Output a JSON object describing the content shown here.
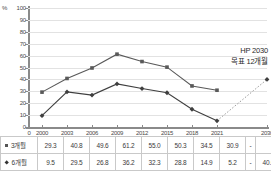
{
  "chart_data": {
    "type": "line",
    "title": "",
    "xlabel": "",
    "ylabel": "%",
    "ylim": [
      0,
      100
    ],
    "ytick_step": 10,
    "yticks": [
      0,
      10,
      20,
      30,
      40,
      50,
      60,
      70,
      80,
      90,
      100
    ],
    "grid": true,
    "legend_position": "table-row-labels",
    "categories": [
      "2000",
      "2003",
      "2006",
      "2009",
      "2012",
      "2015",
      "2018",
      "2021",
      "",
      "2030"
    ],
    "axis_origin_label": "0",
    "series": [
      {
        "name": "3개월",
        "marker": "square",
        "color": "#595959",
        "values": [
          29.3,
          40.8,
          49.6,
          61.2,
          55.0,
          50.3,
          34.5,
          30.9,
          null,
          null
        ],
        "display": [
          "29.3",
          "40.8",
          "49.6",
          "61.2",
          "55.0",
          "50.3",
          "34.5",
          "30.9",
          "-",
          ""
        ]
      },
      {
        "name": "6개월",
        "marker": "diamond",
        "color": "#3f3f3f",
        "values": [
          9.5,
          29.5,
          26.8,
          36.2,
          32.3,
          28.8,
          14.9,
          5.2,
          null,
          40.0
        ],
        "display": [
          "9.5",
          "29.5",
          "26.8",
          "36.2",
          "32.3",
          "28.8",
          "14.9",
          "5.2",
          "-",
          "40.0"
        ],
        "projection": {
          "from_category": "2021",
          "to_category": "2030",
          "from_value": 5.2,
          "to_value": 40.0,
          "style": "dotted"
        }
      }
    ],
    "annotations": [
      {
        "line1": "HP 2030",
        "line2": "목표 12개월"
      }
    ]
  },
  "chart": {
    "y_axis_unit": "%",
    "y_ticks": [
      "100",
      "90",
      "80",
      "70",
      "60",
      "50",
      "40",
      "30",
      "20",
      "10",
      "0"
    ],
    "x_origin": "0",
    "x_ticks": [
      "2000",
      "2003",
      "2006",
      "2009",
      "2012",
      "2015",
      "2018",
      "2021",
      "2030"
    ],
    "annotation_line1": "HP 2030",
    "annotation_line2": "목표 12개월"
  },
  "table": {
    "rows": [
      {
        "label": "3개월",
        "marker": "square",
        "cells": [
          "29.3",
          "40.8",
          "49.6",
          "61.2",
          "55.0",
          "50.3",
          "34.5",
          "30.9",
          "-",
          ""
        ]
      },
      {
        "label": "6개월",
        "marker": "diamond",
        "cells": [
          "9.5",
          "29.5",
          "26.8",
          "36.2",
          "32.3",
          "28.8",
          "14.9",
          "5.2",
          "-",
          "40.0"
        ]
      }
    ]
  },
  "colors": {
    "series_3m": "#595959",
    "series_6m": "#3f3f3f",
    "grid": "#e2e2e2",
    "axis": "#8a8a8a",
    "table_border": "#c9c9c9"
  }
}
